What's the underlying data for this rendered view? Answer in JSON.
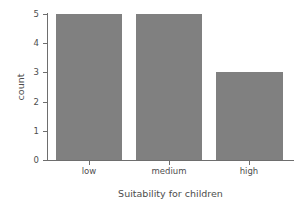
{
  "chart_data": {
    "type": "bar",
    "title": "",
    "subtitle": "",
    "categories": [
      "low",
      "medium",
      "high"
    ],
    "values": [
      5,
      5,
      3
    ],
    "xlabel": "Suitability for children",
    "ylabel": "count",
    "ylim": [
      0,
      5
    ],
    "yticks": [
      0,
      1,
      2,
      3,
      4,
      5
    ],
    "ytick_labels": [
      "0",
      "1",
      "2",
      "3",
      "4",
      "5"
    ],
    "grid": false,
    "legend": null,
    "bar_color": "#808080",
    "axis_color": "#6e6e6e",
    "text_color": "#4d4d4d",
    "background_color": "#ffffff",
    "annotations": []
  }
}
